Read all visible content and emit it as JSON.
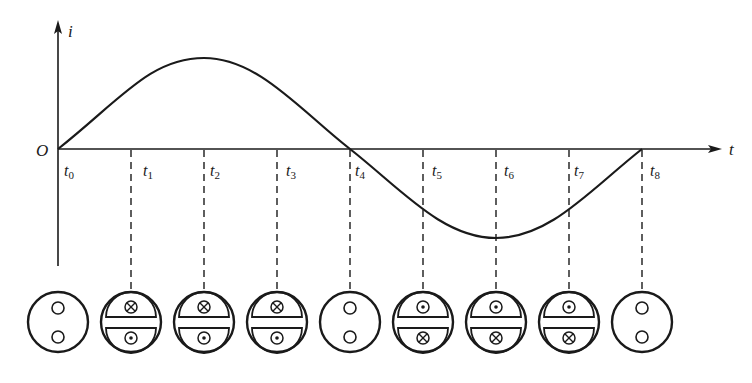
{
  "axes": {
    "y_label": "i",
    "x_label": "t",
    "origin_label": "O"
  },
  "time_labels": [
    {
      "base": "t",
      "sub": "0"
    },
    {
      "base": "t",
      "sub": "1"
    },
    {
      "base": "t",
      "sub": "2"
    },
    {
      "base": "t",
      "sub": "3"
    },
    {
      "base": "t",
      "sub": "4"
    },
    {
      "base": "t",
      "sub": "5"
    },
    {
      "base": "t",
      "sub": "6"
    },
    {
      "base": "t",
      "sub": "7"
    },
    {
      "base": "t",
      "sub": "8"
    }
  ],
  "coil_states": [
    {
      "time": "t0",
      "type": "empty"
    },
    {
      "time": "t1",
      "type": "split",
      "top": "into-page",
      "bottom": "out-of-page"
    },
    {
      "time": "t2",
      "type": "split",
      "top": "into-page",
      "bottom": "out-of-page"
    },
    {
      "time": "t3",
      "type": "split",
      "top": "into-page",
      "bottom": "out-of-page"
    },
    {
      "time": "t4",
      "type": "empty"
    },
    {
      "time": "t5",
      "type": "split",
      "top": "out-of-page",
      "bottom": "into-page"
    },
    {
      "time": "t6",
      "type": "split",
      "top": "out-of-page",
      "bottom": "into-page"
    },
    {
      "time": "t7",
      "type": "split",
      "top": "out-of-page",
      "bottom": "into-page"
    },
    {
      "time": "t8",
      "type": "empty"
    }
  ],
  "curve": {
    "type": "sine",
    "period_labels": "t0 to t8",
    "peak_at": "t2",
    "trough_at": "t6",
    "zero_crossings": [
      "t0",
      "t4",
      "t8"
    ]
  },
  "colors": {
    "stroke": "#1a1a1a",
    "background": "#ffffff"
  }
}
